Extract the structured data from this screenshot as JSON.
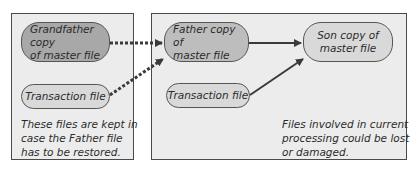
{
  "left_panel": {
    "grandfather": {
      "line1": "Grandfather copy",
      "line2": "of master file"
    },
    "transaction": "Transaction file",
    "note": {
      "line1": "These files are kept in",
      "line2": "case the Father file",
      "line3": "has to be restored."
    }
  },
  "right_panel": {
    "father": {
      "line1": "Father copy of",
      "line2": "master file"
    },
    "transaction": "Transaction file",
    "son": {
      "line1": "Son copy of",
      "line2": "master file"
    },
    "note": {
      "line1": "Files involved in current",
      "line2": "processing could be lost",
      "line3": "or damaged."
    }
  },
  "colors": {
    "panel_bg": "#ececec",
    "panel_border": "#4a4a4a",
    "grandfather_fill": "#a8a8a8",
    "father_fill": "#bdbdbd",
    "son_fill": "#d9d9d9",
    "transaction_fill": "#d9d9d9",
    "arrow": "#3a3a3a"
  }
}
